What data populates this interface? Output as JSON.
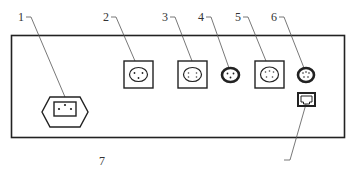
{
  "diagram": {
    "type": "panel-connector-layout",
    "callouts": [
      {
        "id": "1",
        "label": "1",
        "component": "power inlet (hexagonal)"
      },
      {
        "id": "2",
        "label": "2",
        "component": "square multi-pin socket"
      },
      {
        "id": "3",
        "label": "3",
        "component": "square multi-pin socket"
      },
      {
        "id": "4",
        "label": "4",
        "component": "round multi-pin connector"
      },
      {
        "id": "5",
        "label": "5",
        "component": "square multi-pin socket"
      },
      {
        "id": "6",
        "label": "6",
        "component": "round multi-pin connector"
      },
      {
        "id": "7",
        "label": "7",
        "component": "RJ network port"
      }
    ]
  }
}
